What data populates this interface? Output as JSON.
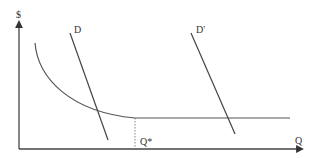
{
  "diagram": {
    "type": "economics-supply-demand",
    "labels": {
      "y_axis": "$",
      "x_axis": "Q",
      "demand_1": "D",
      "demand_2": "D'",
      "quantity_marker": "Q*"
    },
    "colors": {
      "axis": "#444444",
      "curve": "#555555",
      "demand": "#444444",
      "dotted": "#777777",
      "text": "#333333"
    },
    "elements": {
      "y_axis": {
        "x": 19,
        "y_top": 22,
        "y_bottom": 149
      },
      "x_axis": {
        "y": 149,
        "x_left": 19,
        "x_right": 302
      },
      "cost_curve": {
        "description": "downward-sloping convex curve that flattens to horizontal",
        "start": [
          35,
          43
        ],
        "flat_y": 118,
        "flat_from_x": 135,
        "end_x": 290
      },
      "demand_D": {
        "from": [
          70,
          33
        ],
        "to": [
          108,
          140
        ]
      },
      "demand_D_prime": {
        "from": [
          191,
          33
        ],
        "to": [
          235,
          134
        ]
      },
      "q_star_dotted": {
        "x": 135,
        "y_top": 118,
        "y_bottom": 149
      }
    }
  }
}
